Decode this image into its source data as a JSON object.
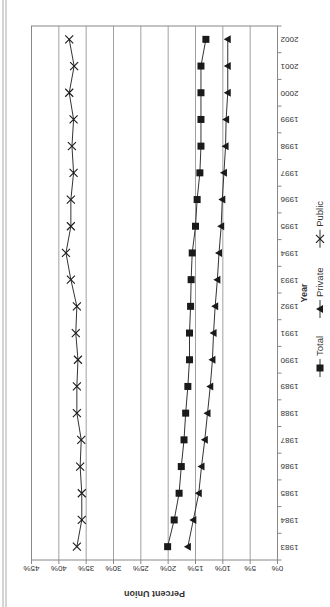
{
  "chart_data": {
    "type": "line",
    "title": "",
    "xlabel": "Year",
    "ylabel": "Percent Union",
    "ylim": [
      0,
      45
    ],
    "yticks": [
      "0%",
      "5%",
      "10%",
      "15%",
      "20%",
      "25%",
      "30%",
      "35%",
      "40%",
      "45%"
    ],
    "ytick_values": [
      0,
      5,
      10,
      15,
      20,
      25,
      30,
      35,
      40,
      45
    ],
    "grid": "horizontal",
    "orientation": "rotated 90 degrees (figure printed sideways)",
    "legend_position": "bottom",
    "categories": [
      "1983",
      "1984",
      "1985",
      "1986",
      "1987",
      "1988",
      "1989",
      "1990",
      "1991",
      "1992",
      "1993",
      "1994",
      "1995",
      "1996",
      "1997",
      "1998",
      "1999",
      "2000",
      "2001",
      "2002"
    ],
    "series": [
      {
        "name": "Total",
        "marker": "square",
        "values": [
          20.1,
          18.9,
          18.0,
          17.6,
          17.1,
          16.8,
          16.4,
          16.1,
          16.1,
          15.9,
          15.8,
          15.6,
          15.0,
          14.7,
          14.2,
          14.0,
          14.0,
          14.0,
          14.0,
          13.1
        ]
      },
      {
        "name": "Private",
        "marker": "triangle",
        "values": [
          16.4,
          15.4,
          14.4,
          13.9,
          13.3,
          12.8,
          12.3,
          11.9,
          11.7,
          11.4,
          11.0,
          10.7,
          10.3,
          10.1,
          9.8,
          9.5,
          9.4,
          9.1,
          9.1,
          9.1
        ]
      },
      {
        "name": "Public",
        "marker": "x",
        "values": [
          36.7,
          35.8,
          35.8,
          36.1,
          35.9,
          36.7,
          36.7,
          36.5,
          36.9,
          36.7,
          37.8,
          38.7,
          37.8,
          37.8,
          37.3,
          37.6,
          37.3,
          38.1,
          37.2,
          38.1
        ]
      }
    ],
    "colors": {
      "line": "#333333",
      "marker": "#1a1a1a",
      "grid": "#a0a0a0",
      "frame": "#888888"
    }
  }
}
